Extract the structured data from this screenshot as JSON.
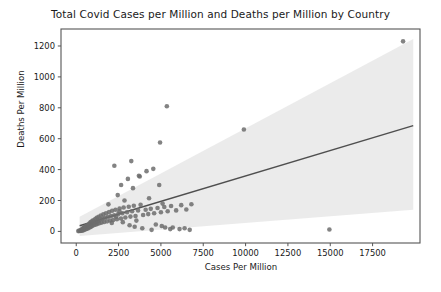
{
  "chart_data": {
    "type": "scatter",
    "title": "Total Covid Cases per Million and Deaths per Million by Country",
    "xlabel": "Cases Per Million",
    "ylabel": "Deaths Per Million",
    "xlim": [
      -900,
      20300
    ],
    "ylim": [
      -75,
      1310
    ],
    "xticks": [
      0,
      2500,
      5000,
      7500,
      10000,
      12500,
      15000,
      17500
    ],
    "xticklabels": [
      "0",
      "2500",
      "5000",
      "7500",
      "10000",
      "12500",
      "15000",
      "17500"
    ],
    "yticks": [
      0,
      200,
      400,
      600,
      800,
      1000,
      1200
    ],
    "yticklabels": [
      "0",
      "200",
      "400",
      "600",
      "800",
      "1000",
      "1200"
    ],
    "grid": false,
    "legend": null,
    "marker_color": "#6d6d6d",
    "marker_size": 4.6,
    "line_color": "#4f4f4f",
    "band_color": "#e8e8e8",
    "regression": {
      "intercept": 30,
      "slope": 0.0329,
      "x_start": 200,
      "x_end": 19900
    },
    "confidence_band": {
      "x_start": 200,
      "x_end": 19900,
      "upper_start": 95,
      "upper_end": 1245,
      "lower_start": -30,
      "lower_end": 140
    },
    "x": [
      120,
      180,
      210,
      260,
      290,
      310,
      330,
      360,
      380,
      400,
      420,
      450,
      470,
      490,
      520,
      540,
      560,
      580,
      600,
      620,
      650,
      680,
      700,
      720,
      740,
      760,
      790,
      810,
      830,
      850,
      880,
      900,
      930,
      950,
      980,
      1000,
      1040,
      1080,
      1120,
      1150,
      1180,
      1210,
      1250,
      1290,
      1320,
      1360,
      1400,
      1450,
      1500,
      1550,
      1600,
      1650,
      1700,
      1760,
      1820,
      1880,
      1940,
      2000,
      2060,
      2120,
      2180,
      2250,
      2320,
      2400,
      2480,
      2560,
      2640,
      2720,
      2800,
      2900,
      3000,
      3100,
      3200,
      3300,
      3400,
      3500,
      3650,
      3800,
      3950,
      4100,
      4250,
      4400,
      4600,
      4800,
      5000,
      5200,
      5400,
      5600,
      5900,
      6200,
      6500,
      6800,
      2250,
      2450,
      2650,
      3050,
      3350,
      3750,
      4150,
      4550,
      4950,
      5350,
      2850,
      3250,
      3700,
      4300,
      4900,
      5100,
      5700,
      6100,
      1900,
      2100,
      2350,
      2550,
      2750,
      3150,
      3450,
      3550,
      3900,
      4450,
      4700,
      5050,
      5250,
      5550,
      6400,
      6700,
      9900,
      14950,
      19300
    ],
    "y": [
      2,
      5,
      3,
      8,
      4,
      12,
      6,
      15,
      9,
      20,
      7,
      25,
      11,
      18,
      30,
      14,
      22,
      35,
      16,
      28,
      40,
      19,
      33,
      45,
      24,
      38,
      52,
      27,
      42,
      60,
      31,
      48,
      66,
      36,
      55,
      72,
      41,
      58,
      80,
      44,
      62,
      88,
      49,
      68,
      95,
      53,
      75,
      102,
      57,
      82,
      110,
      61,
      88,
      118,
      65,
      95,
      126,
      70,
      100,
      134,
      74,
      105,
      140,
      79,
      112,
      148,
      84,
      118,
      155,
      90,
      124,
      160,
      96,
      130,
      166,
      100,
      136,
      172,
      106,
      140,
      112,
      146,
      118,
      152,
      124,
      158,
      130,
      164,
      136,
      170,
      142,
      176,
      425,
      235,
      300,
      340,
      280,
      355,
      390,
      405,
      575,
      810,
      200,
      455,
      360,
      215,
      300,
      180,
      25,
      15,
      175,
      55,
      95,
      130,
      60,
      40,
      30,
      70,
      20,
      10,
      45,
      35,
      25,
      15,
      20,
      10,
      660,
      12,
      1230
    ]
  }
}
